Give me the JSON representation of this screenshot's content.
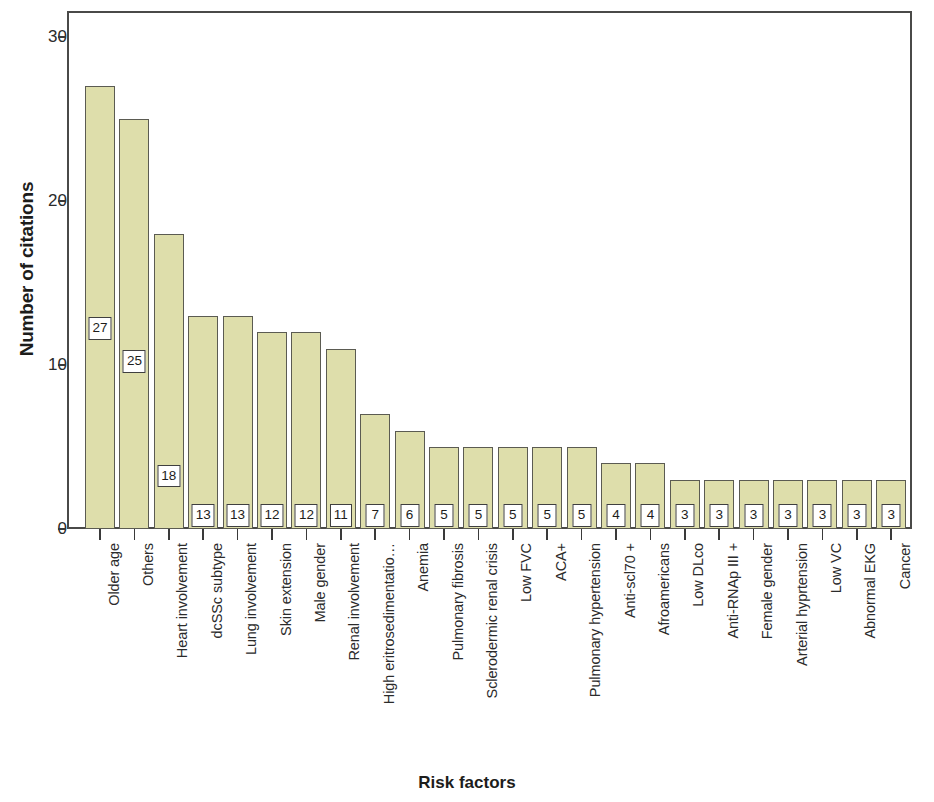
{
  "chart_data": {
    "type": "bar",
    "title": "",
    "xlabel": "Risk factors",
    "ylabel": "Number of citations",
    "ylim": [
      0,
      31.6
    ],
    "yticks": [
      0,
      10,
      20,
      30
    ],
    "ytick_labels": [
      "0",
      "10",
      "20",
      "30"
    ],
    "grid": false,
    "legend": null,
    "bar_color": "#dedeab",
    "bar_edge_color": "#5b5b52",
    "data_label_box": true,
    "categories": [
      "Older age",
      "Others",
      "Heart involvement",
      "dcSSc subtype",
      "Lung involvement",
      "Skin extension",
      "Male gender",
      "Renal involvement",
      "High eritrosedimentatio…",
      "Anemia",
      "Pulmonary fibrosis",
      "Sclerodermic renal crisis",
      "Low FVC",
      "ACA+",
      "Pulmonary hypertension",
      "Anti-scl70 +",
      "Afroamericans",
      "Low DLco",
      "Anti-RNAp III +",
      "Female gender",
      "Arterial hyprtension",
      "Low VC",
      "Abnormal EKG",
      "Cancer"
    ],
    "values": [
      27,
      25,
      18,
      13,
      13,
      12,
      12,
      11,
      7,
      6,
      5,
      5,
      5,
      5,
      5,
      4,
      4,
      3,
      3,
      3,
      3,
      3,
      3,
      3
    ],
    "value_labels": [
      "27",
      "25",
      "18",
      "13",
      "13",
      "12",
      "12",
      "11",
      "7",
      "6",
      "5",
      "5",
      "5",
      "5",
      "5",
      "4",
      "4",
      "3",
      "3",
      "3",
      "3",
      "3",
      "3",
      "3"
    ]
  }
}
